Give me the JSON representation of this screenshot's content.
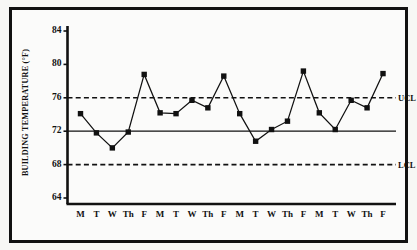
{
  "chart_data": {
    "type": "line",
    "title": "",
    "subtitle": "",
    "xlabel": "",
    "ylabel": "BUILDING TEMPERATURE (°F)",
    "categories": [
      "M",
      "T",
      "W",
      "Th",
      "F",
      "M",
      "T",
      "W",
      "Th",
      "F",
      "M",
      "T",
      "W",
      "Th",
      "F",
      "M",
      "T",
      "W",
      "Th",
      "F"
    ],
    "values": [
      74.1,
      71.8,
      70.0,
      71.9,
      78.8,
      74.2,
      74.1,
      75.7,
      74.8,
      78.6,
      74.1,
      70.8,
      72.2,
      73.2,
      79.2,
      74.2,
      72.2,
      75.7,
      74.8,
      78.9
    ],
    "series": [
      {
        "name": "Building temperature",
        "values": [
          74.1,
          71.8,
          70.0,
          71.9,
          78.8,
          74.2,
          74.1,
          75.7,
          74.8,
          78.6,
          74.1,
          70.8,
          72.2,
          73.2,
          79.2,
          74.2,
          72.2,
          75.7,
          74.8,
          78.9
        ]
      }
    ],
    "ylim": [
      63.0,
      84.5
    ],
    "yticks": [
      64,
      68,
      72,
      76,
      80,
      84
    ],
    "ytick_labels": [
      "64",
      "68",
      "72",
      "76",
      "80",
      "84"
    ],
    "grid": false,
    "legend": "none",
    "marker": "square",
    "line_color": "#111111",
    "marker_color": "#111111",
    "reference_lines": [
      {
        "id": "ucl",
        "label": "UCL",
        "value": 76,
        "style": "dashed"
      },
      {
        "id": "center",
        "label": "",
        "value": 72,
        "style": "solid"
      },
      {
        "id": "lcl",
        "label": "LCL",
        "value": 68,
        "style": "dashed"
      }
    ]
  },
  "labels": {
    "ucl": "UCL",
    "lcl": "LCL"
  },
  "colors": {
    "ink": "#111111",
    "paper": "#fbfbfa",
    "frame": "#111111"
  }
}
